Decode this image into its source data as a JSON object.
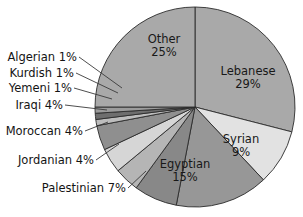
{
  "chart_data": {
    "type": "pie",
    "title": "",
    "subtitle": "",
    "xlabel": "",
    "ylabel": "",
    "legend_position": "none",
    "grid": false,
    "units": "percent",
    "start_angle_deg": 0,
    "direction": "clockwise",
    "categories": [
      "Lebanese",
      "Syrian",
      "Egyptian",
      "Palestinian",
      "Jordanian",
      "Moroccan",
      "Iraqi",
      "Yemeni",
      "Kurdish",
      "Algerian",
      "Other"
    ],
    "values": [
      29,
      9,
      15,
      7,
      4,
      4,
      4,
      1,
      1,
      1,
      25
    ],
    "slices": [
      {
        "name": "Lebanese",
        "value": 29,
        "label": "Lebanese",
        "value_label": "29%",
        "color": "#a9a9a9",
        "label_placement": "inside"
      },
      {
        "name": "Syrian",
        "value": 9,
        "label": "Syrian",
        "value_label": "9%",
        "color": "#e2e2e2",
        "label_placement": "inside"
      },
      {
        "name": "Egyptian",
        "value": 15,
        "label": "Egyptian",
        "value_label": "15%",
        "color": "#979797",
        "label_placement": "inside"
      },
      {
        "name": "Palestinian",
        "value": 7,
        "label": "Palestinian 7%",
        "value_label": "7%",
        "color": "#888888",
        "label_placement": "outside"
      },
      {
        "name": "Jordanian",
        "value": 4,
        "label": "Jordanian 4%",
        "value_label": "4%",
        "color": "#b5b5b5",
        "label_placement": "outside"
      },
      {
        "name": "Moroccan",
        "value": 4,
        "label": "Moroccan 4%",
        "value_label": "4%",
        "color": "#d6d6d6",
        "label_placement": "outside"
      },
      {
        "name": "Iraqi",
        "value": 4,
        "label": "Iraqi 4%",
        "value_label": "4%",
        "color": "#8f8f8f",
        "label_placement": "outside"
      },
      {
        "name": "Yemeni",
        "value": 1,
        "label": "Yemeni 1%",
        "value_label": "1%",
        "color": "#bdbdbd",
        "label_placement": "outside"
      },
      {
        "name": "Kurdish",
        "value": 1,
        "label": "Kurdish 1%",
        "value_label": "1%",
        "color": "#6e6e6e",
        "label_placement": "outside"
      },
      {
        "name": "Algerian",
        "value": 1,
        "label": "Algerian 1%",
        "value_label": "1%",
        "color": "#9c9c9c",
        "label_placement": "outside"
      },
      {
        "name": "Other",
        "value": 25,
        "label": "Other",
        "value_label": "25%",
        "color": "#a9a9a9",
        "label_placement": "inside"
      }
    ]
  },
  "inside_labels": {
    "other": {
      "name": "Other",
      "value": "25%"
    },
    "lebanese": {
      "name": "Lebanese",
      "value": "29%"
    },
    "syrian": {
      "name": "Syrian",
      "value": "9%"
    },
    "egyptian": {
      "name": "Egyptian",
      "value": "15%"
    }
  },
  "outside_labels": {
    "algerian": "Algerian 1%",
    "kurdish": "Kurdish 1%",
    "yemeni": "Yemeni 1%",
    "iraqi": "Iraqi 4%",
    "moroccan": "Moroccan 4%",
    "jordanian": "Jordanian 4%",
    "palestinian": "Palestinian 7%"
  },
  "style": {
    "background": "#ffffff",
    "outline": "#2b2b2b",
    "text": "#141414"
  }
}
